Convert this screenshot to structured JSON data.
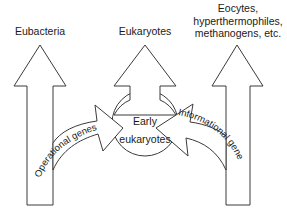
{
  "diagram": {
    "type": "evolutionary-flow",
    "nodes": [
      {
        "id": "eubacteria",
        "label": "Eubacteria"
      },
      {
        "id": "eukaryotes",
        "label": "Eukaryotes"
      },
      {
        "id": "eocytes",
        "label_lines": [
          "Eocytes,",
          "hyperthermophiles,",
          "methanogens, etc."
        ]
      },
      {
        "id": "early-eukaryotes",
        "label_lines": [
          "Early",
          "eukaryotes"
        ]
      }
    ],
    "edges": [
      {
        "from": "eubacteria-lineage",
        "to": "early-eukaryotes",
        "label": "Operational genes"
      },
      {
        "from": "eocytes-lineage",
        "to": "early-eukaryotes",
        "label": "Informational genes"
      },
      {
        "from": "early-eukaryotes",
        "to": "eukaryotes",
        "label": ""
      }
    ]
  },
  "labels": {
    "eubacteria": "Eubacteria",
    "eukaryotes": "Eukaryotes",
    "eocytes_line1": "Eocytes,",
    "eocytes_line2": "hyperthermophiles,",
    "eocytes_line3": "methanogens, etc.",
    "early_line1": "Early",
    "early_line2": "eukaryotes",
    "operational": "Operational genes",
    "informational": "Informational genes"
  },
  "colors": {
    "stroke": "#3a3a3a",
    "fill": "#ffffff",
    "text": "#1a1a1a"
  }
}
